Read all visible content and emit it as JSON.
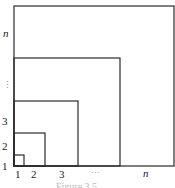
{
  "diagram": {
    "type": "nested-squares",
    "line_color": "#2a2a2a",
    "squares": [
      {
        "label": "1",
        "right": 24,
        "top": 155
      },
      {
        "label": "2",
        "right": 45,
        "top": 133
      },
      {
        "label": "3",
        "right": 78,
        "top": 101
      },
      {
        "label": "...",
        "right": 120,
        "top": 58
      },
      {
        "label": "n",
        "right": 174,
        "top": 6
      }
    ],
    "origin": {
      "x": 14,
      "y": 166
    }
  },
  "x_labels": [
    "1",
    "2",
    "3",
    "···",
    "n"
  ],
  "y_labels": [
    "1",
    "2",
    "3",
    "⋮",
    "n"
  ],
  "caption": "Figure 3.5"
}
